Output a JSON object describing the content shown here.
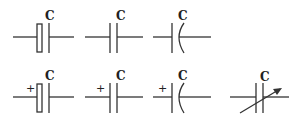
{
  "diagram": {
    "symbols": [
      {
        "id": "electrolytic",
        "label": "C",
        "polarity": ""
      },
      {
        "id": "fixed",
        "label": "C",
        "polarity": ""
      },
      {
        "id": "curved-plate",
        "label": "C",
        "polarity": ""
      },
      {
        "id": "electrolytic-polarized",
        "label": "C",
        "polarity": "+"
      },
      {
        "id": "fixed-polarized",
        "label": "C",
        "polarity": "+"
      },
      {
        "id": "curved-plate-polarized",
        "label": "C",
        "polarity": "+"
      },
      {
        "id": "variable",
        "label": "C",
        "polarity": ""
      }
    ]
  },
  "colors": {
    "stroke": "#333333",
    "background": "#ffffff"
  }
}
